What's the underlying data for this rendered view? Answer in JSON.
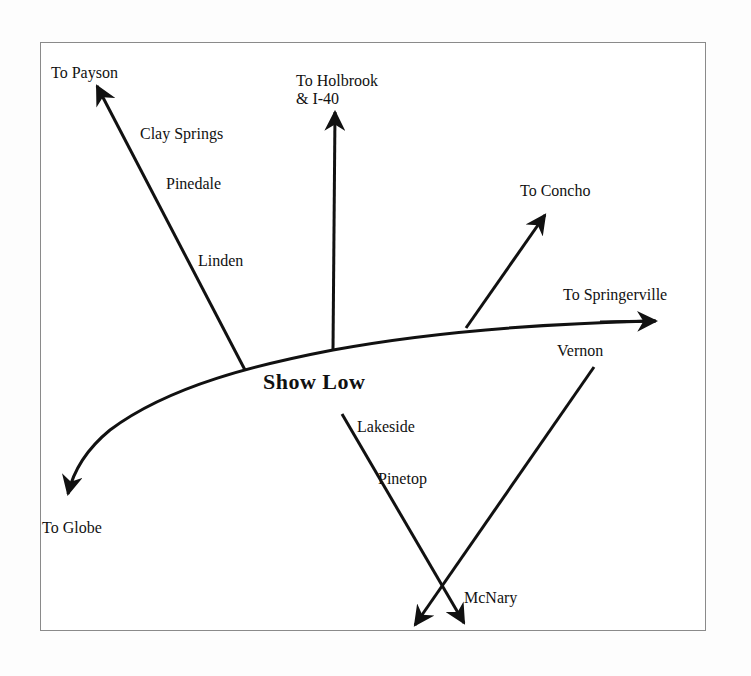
{
  "map": {
    "center_town": "Show Low",
    "destinations": {
      "payson": "To Payson",
      "holbrook_line1": "To Holbrook",
      "holbrook_line2": "& I-40",
      "concho": "To Concho",
      "springerville": "To Springerville",
      "globe": "To Globe"
    },
    "towns": {
      "clay_springs": "Clay Springs",
      "pinedale": "Pinedale",
      "linden": "Linden",
      "lakeside": "Lakeside",
      "pinetop": "Pinetop",
      "vernon": "Vernon",
      "mcnary": "McNary"
    },
    "colors": {
      "road": "#111111",
      "frame": "#8a8a8a",
      "background": "#ffffff"
    }
  }
}
